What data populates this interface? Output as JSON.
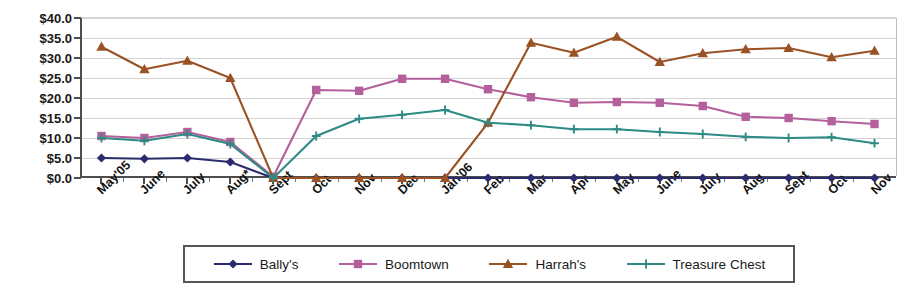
{
  "chart_data": {
    "type": "line",
    "title": "",
    "xlabel": "",
    "ylabel": "",
    "ylim": [
      0,
      40
    ],
    "ytick_step": 5,
    "grid": true,
    "legend_position": "bottom",
    "value_prefix": "$",
    "ytick_labels": [
      "$40.0",
      "$35.0",
      "$30.0",
      "$25.0",
      "$20.0",
      "$15.0",
      "$10.0",
      "$5.0",
      "$0.0"
    ],
    "ytick_values": [
      40,
      35,
      30,
      25,
      20,
      15,
      10,
      5,
      0
    ],
    "categories": [
      "May'05",
      "June",
      "July",
      "Aug*",
      "Sept",
      "Oct",
      "Nov",
      "Dec",
      "Jan'06",
      "Feb",
      "Mar",
      "Apr",
      "May",
      "June",
      "July",
      "Aug",
      "Sept",
      "Oct",
      "Nov"
    ],
    "series": [
      {
        "name": "Bally's",
        "color": "#2b2b6e",
        "marker": "diamond",
        "values": [
          5.0,
          4.8,
          5.0,
          4.0,
          0.0,
          0.0,
          0.0,
          0.0,
          0.0,
          0.0,
          0.0,
          0.0,
          0.0,
          0.0,
          0.0,
          0.0,
          0.0,
          0.0,
          0.0
        ]
      },
      {
        "name": "Boomtown",
        "color": "#b3609c",
        "marker": "square",
        "values": [
          10.5,
          10.0,
          11.5,
          9.0,
          0.3,
          22.0,
          21.8,
          24.8,
          24.8,
          22.2,
          20.2,
          18.8,
          19.0,
          18.8,
          18.0,
          15.3,
          15.0,
          14.2,
          13.5
        ]
      },
      {
        "name": "Harrah's",
        "color": "#9a5224",
        "marker": "triangle",
        "values": [
          32.8,
          27.2,
          29.3,
          25.0,
          0.0,
          0.0,
          0.0,
          0.0,
          0.0,
          13.8,
          33.8,
          31.3,
          35.3,
          29.0,
          31.2,
          32.2,
          32.5,
          30.2,
          31.8
        ]
      },
      {
        "name": "Treasure Chest",
        "color": "#2e8b84",
        "marker": "plus",
        "values": [
          10.0,
          9.3,
          11.0,
          8.5,
          0.0,
          10.5,
          14.8,
          15.8,
          17.0,
          13.8,
          13.2,
          12.2,
          12.2,
          11.5,
          11.0,
          10.3,
          10.0,
          10.2,
          8.7
        ]
      }
    ],
    "legend": [
      {
        "label": "Bally's",
        "color": "#2b2b6e",
        "marker": "diamond"
      },
      {
        "label": "Boomtown",
        "color": "#b3609c",
        "marker": "square"
      },
      {
        "label": "Harrah's",
        "color": "#9a5224",
        "marker": "triangle"
      },
      {
        "label": "Treasure Chest",
        "color": "#2e8b84",
        "marker": "plus"
      }
    ]
  }
}
